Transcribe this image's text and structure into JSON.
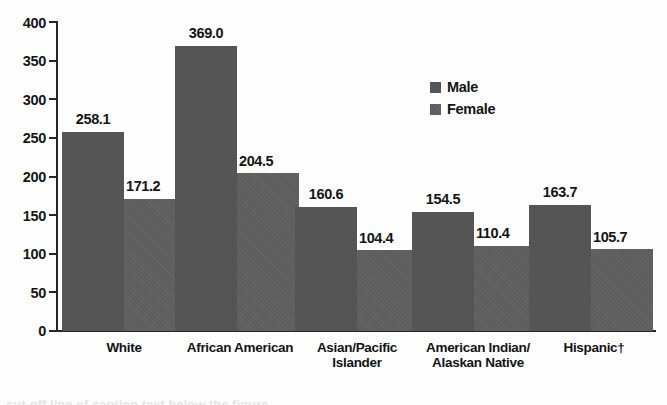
{
  "chart_data": {
    "type": "bar",
    "title": "",
    "xlabel": "",
    "ylabel": "",
    "ylim": [
      0,
      400
    ],
    "ytick_step": 50,
    "yticks": [
      400,
      350,
      300,
      250,
      200,
      150,
      100,
      50,
      0
    ],
    "ytick_labels": [
      "400",
      "350",
      "300",
      "250",
      "200",
      "150",
      "100",
      "50",
      "0"
    ],
    "grid": false,
    "legend_position": "inside upper-right",
    "categories": [
      "White",
      "African American",
      "Asian/Pacific Islander",
      "American Indian/ Alaskan Native",
      "Hispanic†"
    ],
    "category_lines": [
      [
        "White",
        ""
      ],
      [
        "African American",
        ""
      ],
      [
        "Asian/Pacific",
        "Islander"
      ],
      [
        "American Indian/",
        "Alaskan Native"
      ],
      [
        "Hispanic†",
        ""
      ]
    ],
    "series": [
      {
        "name": "Male",
        "color": "#555555",
        "values": [
          258.1,
          369.0,
          160.6,
          154.5,
          163.7
        ],
        "labels": [
          "258.1",
          "369.0",
          "160.6",
          "154.5",
          "163.7"
        ]
      },
      {
        "name": "Female",
        "color": "#5d5d5d",
        "values": [
          171.2,
          204.5,
          104.4,
          110.4,
          105.7
        ],
        "labels": [
          "171.2",
          "204.5",
          "104.4",
          "110.4",
          "105.7"
        ]
      }
    ],
    "annotations": [
      "† denotes footnote marker on Hispanic category"
    ]
  },
  "legend": {
    "items": [
      {
        "label": "Male",
        "swatch": "male-swatch-icon"
      },
      {
        "label": "Female",
        "swatch": "female-swatch-icon"
      }
    ]
  },
  "caption_remnant": "cut-off line of caption text below the figure"
}
